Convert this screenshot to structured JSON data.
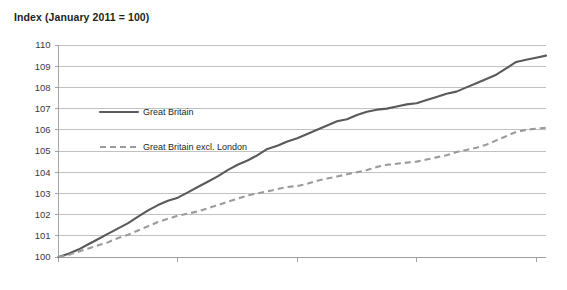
{
  "chart_data": {
    "type": "line",
    "title": "Index (January 2011 = 100)",
    "xlabel": "",
    "ylabel": "",
    "ylim": [
      100,
      110
    ],
    "ytick_labels": [
      "100",
      "101",
      "102",
      "103",
      "104",
      "105",
      "106",
      "107",
      "108",
      "109",
      "110"
    ],
    "yticks": [
      100,
      101,
      102,
      103,
      104,
      105,
      106,
      107,
      108,
      109,
      110
    ],
    "xtick_labels": [
      "Jan 2011",
      "Jan 2012",
      "Jan 2013",
      "Jan 2014",
      "Jan 2015"
    ],
    "xticks": [
      0,
      12,
      24,
      36,
      48
    ],
    "x_months": [
      0,
      1,
      2,
      3,
      4,
      5,
      6,
      7,
      8,
      9,
      10,
      11,
      12,
      13,
      14,
      15,
      16,
      17,
      18,
      19,
      20,
      21,
      22,
      23,
      24,
      25,
      26,
      27,
      28,
      29,
      30,
      31,
      32,
      33,
      34,
      35,
      36,
      37,
      38,
      39,
      40,
      41,
      42,
      43,
      44,
      45,
      46,
      47,
      48,
      49
    ],
    "grid": true,
    "legend_position": "inside-upper-left",
    "series": [
      {
        "name": "Great Britain",
        "style": "solid",
        "color": "#5a5a5a",
        "values": [
          100.0,
          100.15,
          100.35,
          100.6,
          100.85,
          101.1,
          101.35,
          101.6,
          101.9,
          102.2,
          102.45,
          102.65,
          102.8,
          103.05,
          103.3,
          103.55,
          103.8,
          104.1,
          104.35,
          104.55,
          104.8,
          105.1,
          105.25,
          105.45,
          105.6,
          105.8,
          106.0,
          106.2,
          106.4,
          106.5,
          106.7,
          106.85,
          106.95,
          107.0,
          107.1,
          107.2,
          107.25,
          107.4,
          107.55,
          107.7,
          107.8,
          108.0,
          108.2,
          108.4,
          108.6,
          108.9,
          109.2,
          109.3,
          109.4,
          109.5
        ]
      },
      {
        "name": "Great Britain excl. London",
        "style": "dashed",
        "color": "#9b9b9b",
        "values": [
          100.0,
          100.1,
          100.25,
          100.4,
          100.55,
          100.7,
          100.9,
          101.05,
          101.25,
          101.45,
          101.65,
          101.8,
          101.95,
          102.05,
          102.15,
          102.3,
          102.45,
          102.6,
          102.75,
          102.9,
          103.0,
          103.1,
          103.2,
          103.3,
          103.35,
          103.45,
          103.6,
          103.7,
          103.8,
          103.9,
          104.0,
          104.1,
          104.25,
          104.35,
          104.4,
          104.45,
          104.5,
          104.6,
          104.7,
          104.8,
          104.95,
          105.05,
          105.15,
          105.3,
          105.5,
          105.7,
          105.9,
          106.0,
          106.05,
          106.1
        ]
      }
    ]
  },
  "legend": {
    "items": [
      {
        "label": "Great Britain"
      },
      {
        "label": "Great Britain excl. London"
      }
    ]
  }
}
